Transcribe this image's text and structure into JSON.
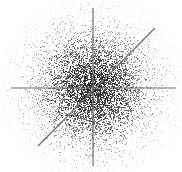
{
  "figure": {
    "width": 182,
    "height": 172,
    "background_color": "#ffffff",
    "title": "",
    "xlabel": "",
    "ylabel": ""
  },
  "chart_data": {
    "type": "scatter",
    "title": "",
    "subtitle": "",
    "xlabel": "",
    "ylabel": "",
    "grid": false,
    "legend": "none",
    "annotations": [],
    "xlim": [
      0,
      182
    ],
    "ylim": [
      0,
      172
    ],
    "tick_labels": {
      "x": [],
      "y": []
    },
    "point_cloud": {
      "center_x": 93,
      "center_y": 88,
      "n_points": 5200,
      "sigma_x": 26,
      "sigma_y": 26,
      "core_radius": 14,
      "max_radius": 95,
      "point_size_px": 1,
      "point_color": "#1a1a1a",
      "point_opacity_core": 0.85,
      "point_opacity_edge": 0.18
    },
    "overlay_lines": [
      {
        "name": "horizontal-axis-line",
        "x1": 11,
        "y1": 88,
        "x2": 176,
        "y2": 88,
        "color": "#6e6e6e",
        "width": 1.2,
        "angle_deg": 0
      },
      {
        "name": "vertical-axis-line",
        "x1": 93,
        "y1": 8,
        "x2": 93,
        "y2": 166,
        "color": "#6e6e6e",
        "width": 1.2,
        "angle_deg": 90
      },
      {
        "name": "diagonal-trend-line",
        "x1": 38,
        "y1": 146,
        "x2": 155,
        "y2": 28,
        "color": "#6e6e6e",
        "width": 1.2,
        "angle_deg": 45
      }
    ]
  }
}
